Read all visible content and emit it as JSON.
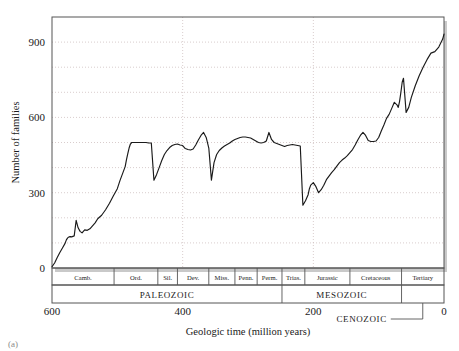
{
  "figure": {
    "background_color": "#ffffff",
    "line_color": "#1a1a1a",
    "frame_color": "#555555",
    "grid_color": "#c8b8b8",
    "shadow_color": "#c9c9c9",
    "corner_mark": "(a)"
  },
  "chart_data": {
    "type": "line",
    "title": "",
    "xlabel": "Geologic time (million years)",
    "ylabel": "Number of families",
    "xlim": [
      600,
      0
    ],
    "ylim": [
      0,
      1000
    ],
    "x_ticks": [
      600,
      400,
      200,
      0
    ],
    "y_ticks": [
      0,
      300,
      600,
      900
    ],
    "grid": true,
    "grid_y_step": 100,
    "grid_x_step": 200,
    "x_axis_reversed": true,
    "legend": "none",
    "series": [
      {
        "name": "Marine animal families",
        "x": [
          600,
          596,
          592,
          588,
          584,
          580,
          578,
          576,
          574,
          572,
          570,
          568,
          566,
          563,
          560,
          557,
          554,
          550,
          546,
          542,
          538,
          534,
          530,
          524,
          518,
          512,
          506,
          500,
          496,
          492,
          488,
          486,
          484,
          482,
          480,
          478,
          476,
          472,
          468,
          464,
          460,
          456,
          452,
          448,
          444,
          440,
          436,
          432,
          428,
          424,
          420,
          416,
          412,
          408,
          404,
          400,
          396,
          392,
          388,
          384,
          380,
          376,
          372,
          368,
          364,
          360,
          356,
          352,
          348,
          344,
          340,
          336,
          332,
          328,
          324,
          320,
          316,
          312,
          308,
          304,
          300,
          296,
          292,
          288,
          284,
          280,
          276,
          272,
          268,
          264,
          260,
          256,
          252,
          250,
          248,
          246,
          244,
          242,
          240,
          236,
          232,
          228,
          224,
          220,
          216,
          212,
          208,
          206,
          204,
          200,
          196,
          192,
          188,
          184,
          180,
          176,
          172,
          168,
          164,
          160,
          156,
          152,
          148,
          144,
          140,
          136,
          132,
          128,
          124,
          120,
          116,
          112,
          108,
          104,
          100,
          96,
          92,
          88,
          84,
          80,
          76,
          72,
          70,
          68,
          66,
          64,
          62,
          58,
          54,
          50,
          44,
          38,
          32,
          26,
          20,
          14,
          8,
          2,
          0
        ],
        "y": [
          5,
          20,
          42,
          62,
          80,
          98,
          112,
          120,
          124,
          125,
          124,
          126,
          128,
          190,
          160,
          146,
          140,
          152,
          150,
          156,
          168,
          180,
          196,
          210,
          232,
          258,
          288,
          316,
          348,
          376,
          404,
          432,
          456,
          478,
          494,
          500,
          500,
          500,
          500,
          500,
          500,
          500,
          498,
          498,
          350,
          372,
          400,
          428,
          452,
          468,
          480,
          488,
          492,
          494,
          490,
          488,
          476,
          472,
          470,
          474,
          490,
          510,
          528,
          540,
          520,
          478,
          350,
          420,
          452,
          468,
          478,
          486,
          492,
          498,
          506,
          512,
          516,
          520,
          522,
          522,
          520,
          518,
          512,
          506,
          500,
          498,
          500,
          506,
          540,
          512,
          500,
          496,
          492,
          490,
          488,
          486,
          484,
          486,
          488,
          490,
          492,
          490,
          488,
          486,
          250,
          268,
          292,
          316,
          330,
          340,
          324,
          300,
          312,
          330,
          352,
          366,
          380,
          392,
          406,
          420,
          430,
          438,
          448,
          460,
          472,
          490,
          510,
          528,
          540,
          528,
          508,
          504,
          504,
          506,
          520,
          546,
          570,
          596,
          612,
          636,
          660,
          650,
          640,
          664,
          700,
          740,
          756,
          620,
          640,
          680,
          726,
          766,
          800,
          830,
          856,
          862,
          880,
          912,
          932
        ]
      }
    ],
    "periods": [
      {
        "label": "Camb.",
        "start": 600,
        "end": 505
      },
      {
        "label": "Ord.",
        "start": 505,
        "end": 438
      },
      {
        "label": "Sil.",
        "start": 438,
        "end": 408
      },
      {
        "label": "Dev.",
        "start": 408,
        "end": 360
      },
      {
        "label": "Miss.",
        "start": 360,
        "end": 320
      },
      {
        "label": "Penn.",
        "start": 320,
        "end": 286
      },
      {
        "label": "Perm.",
        "start": 286,
        "end": 248
      },
      {
        "label": "Trias.",
        "start": 248,
        "end": 213
      },
      {
        "label": "Jurassic",
        "start": 213,
        "end": 144
      },
      {
        "label": "Cretaceous",
        "start": 144,
        "end": 65
      },
      {
        "label": "Tertiary",
        "start": 65,
        "end": 0
      }
    ],
    "eras": [
      {
        "label": "PALEOZOIC",
        "start": 600,
        "end": 248
      },
      {
        "label": "MESOZOIC",
        "start": 248,
        "end": 65
      },
      {
        "label": "CENOZOIC",
        "start": 65,
        "end": 0,
        "callout": true
      }
    ]
  }
}
